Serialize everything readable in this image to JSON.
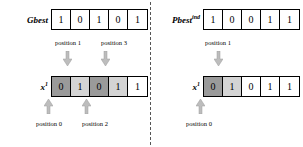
{
  "figure": {
    "divider": "vertical-dashed-line",
    "colors": {
      "cell_shade_dark": "#9a9a9a",
      "cell_shade_light": "#d4d4d4",
      "cell_shade_none": "#ffffff",
      "arrow": "#bdbdbd",
      "arrow_outline": "#8d8d8d",
      "border": "#000000"
    }
  },
  "left": {
    "source": {
      "label": "Gbest",
      "superscript": "",
      "bits": [
        "1",
        "0",
        "1",
        "0",
        "1"
      ],
      "shades": [
        "none",
        "none",
        "none",
        "none",
        "none"
      ]
    },
    "target": {
      "label": "x",
      "superscript": "1",
      "bits": [
        "0",
        "1",
        "0",
        "1",
        "1"
      ],
      "shades": [
        "dark",
        "light",
        "dark",
        "light",
        "none"
      ]
    },
    "top_positions": [
      {
        "text": "position 1"
      },
      {
        "text": "position 3"
      }
    ],
    "bottom_positions": [
      {
        "text": "position 0"
      },
      {
        "text": "position 2"
      }
    ]
  },
  "right": {
    "source": {
      "label": "Pbest",
      "superscript": "ind",
      "bits": [
        "1",
        "0",
        "0",
        "1",
        "1"
      ],
      "shades": [
        "none",
        "none",
        "none",
        "none",
        "none"
      ]
    },
    "target": {
      "label": "x",
      "superscript": "1",
      "bits": [
        "0",
        "1",
        "0",
        "1",
        "1"
      ],
      "shades": [
        "dark",
        "light",
        "none",
        "none",
        "none"
      ]
    },
    "top_positions": [
      {
        "text": "position 1"
      }
    ],
    "bottom_positions": [
      {
        "text": "position 0"
      }
    ]
  }
}
